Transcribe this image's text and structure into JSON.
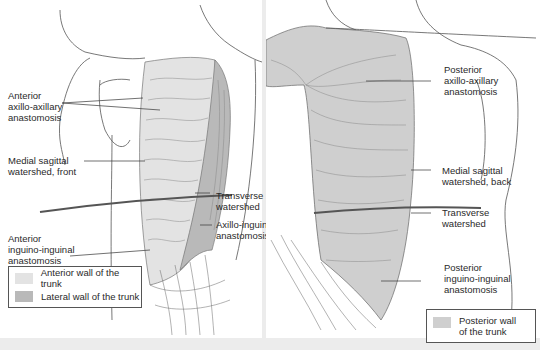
{
  "colors": {
    "background": "#ececec",
    "panel": "#ffffff",
    "anterior_wall": "#e3e3e3",
    "lateral_wall": "#b9b9b9",
    "posterior_wall": "#cfcfcf",
    "line": "#555555"
  },
  "left_panel": {
    "labels": {
      "anterior_axillo_axillary": [
        "Anterior",
        "axillo-axillary",
        "anastomosis"
      ],
      "medial_sagittal_front": [
        "Medial sagittal",
        "watershed, front"
      ],
      "transverse_watershed": [
        "Transverse",
        "watershed"
      ],
      "axillo_inguinal": [
        "Axillo-inguinal",
        "anastomosis"
      ],
      "anterior_inguino_inguinal": [
        "Anterior",
        "inguino-inguinal",
        "anastomosis"
      ]
    },
    "legend": [
      {
        "label": "Anterior wall of the trunk",
        "color": "#e3e3e3"
      },
      {
        "label": "Lateral wall of the trunk",
        "color": "#b9b9b9"
      }
    ]
  },
  "right_panel": {
    "labels": {
      "posterior_axillo_axillary": [
        "Posterior",
        "axillo-axillary",
        "anastomosis"
      ],
      "medial_sagittal_back": [
        "Medial sagittal",
        "watershed, back"
      ],
      "transverse_watershed": [
        "Transverse",
        "watershed"
      ],
      "posterior_inguino_inguinal": [
        "Posterior",
        "inguino-inguinal",
        "anastomosis"
      ]
    },
    "legend": [
      {
        "label": [
          "Posterior wall",
          "of the trunk"
        ],
        "color": "#cfcfcf"
      }
    ]
  }
}
